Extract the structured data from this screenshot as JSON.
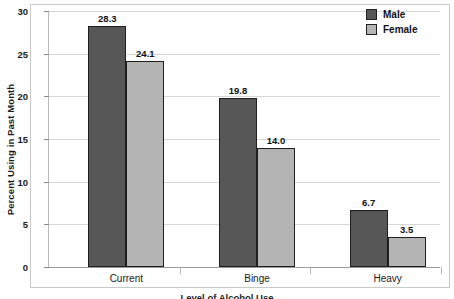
{
  "chart_data": {
    "type": "bar",
    "title": "",
    "subtitle": "",
    "xlabel": "Level of Alcohol Use",
    "ylabel": "Percent Using in Past Month",
    "categories": [
      "Current",
      "Binge",
      "Heavy"
    ],
    "series": [
      {
        "name": "Male",
        "values": [
          28.3,
          19.8,
          6.7
        ],
        "color": "#575757"
      },
      {
        "name": "Female",
        "values": [
          24.1,
          14.0,
          3.5
        ],
        "color": "#b4b4b4"
      }
    ],
    "value_labels": [
      [
        "28.3",
        "24.1"
      ],
      [
        "19.8",
        "14.0"
      ],
      [
        "6.7",
        "3.5"
      ]
    ],
    "ylim": [
      0,
      30
    ],
    "ytick_labels": [
      "0",
      "5",
      "10",
      "15",
      "20",
      "25",
      "30"
    ],
    "ytick_values": [
      0,
      5,
      10,
      15,
      20,
      25,
      30
    ],
    "grid": "horizontal",
    "legend_position": "top-right",
    "legend_entries": [
      "Male",
      "Female"
    ],
    "bar_border_color": "#1f1f1f",
    "gridline_color": "#d6d6d6",
    "frame_color": "#c9c9c9",
    "background": "#ffffff"
  },
  "axes": {
    "y_title": "Percent Using in Past Month",
    "x_title": "Level of Alcohol Use"
  },
  "legend": {
    "items": [
      {
        "label": "Male",
        "swatch": "legend-swatch-male"
      },
      {
        "label": "Female",
        "swatch": "legend-swatch-female"
      }
    ]
  }
}
